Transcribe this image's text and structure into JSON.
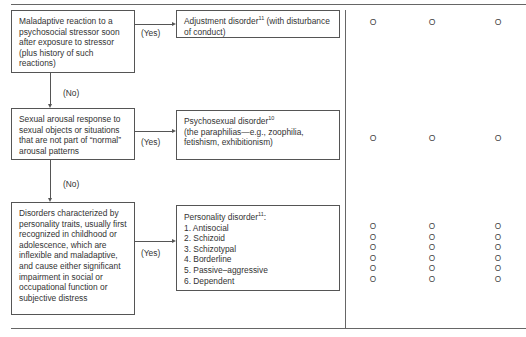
{
  "flowchart": {
    "nodes": [
      {
        "condition": "Maladaptive reaction to a psychosocial stressor soon after exposure to stressor (plus history of such reactions)",
        "yes_label": "(Yes)",
        "result_title": "Adjustment disorder",
        "result_sup": "11",
        "result_rest": "(with disturbance of conduct)",
        "marks": [
          "O",
          "O",
          "O"
        ]
      },
      {
        "no_label": "(No)",
        "condition": "Sexual arousal response to sexual objects or situations that are not part of “normal” arousal patterns",
        "yes_label": "(Yes)",
        "result_title": "Psychosexual disorder",
        "result_sup": "10",
        "result_rest": "(the paraphilias—e.g., zoophilia, fetishism, exhibitionism)",
        "marks": [
          "O",
          "O",
          "O"
        ]
      },
      {
        "no_label": "(No)",
        "condition": "Disorders characterized by personality traits, usually first recognized in childhood or adolescence, which are inflexible and maladaptive, and cause either significant impairment in social or occupational function or subjective distress",
        "yes_label": "(Yes)",
        "result_title": "Personality disorder",
        "result_sup": "11",
        "result_suffix": ":",
        "result_list": [
          "1. Antisocial",
          "2. Schizoid",
          "3. Schizotypal",
          "4. Borderline",
          "5. Passive–aggressive",
          "6. Dependent"
        ],
        "marks_col": [
          "O",
          "O",
          "O",
          "O",
          "O",
          "O"
        ]
      }
    ]
  }
}
